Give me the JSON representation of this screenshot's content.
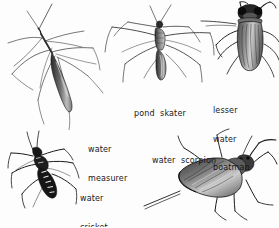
{
  "plate": {
    "title": "Water bugs",
    "background_color": "#fdfdfd",
    "ink_color": "#1a1a1a",
    "width": 279,
    "height": 227
  },
  "labels": {
    "water_measurer": {
      "line1": "water",
      "line2": "measurer"
    },
    "pond_skater": {
      "line1": "pond  skater"
    },
    "lesser_water_boatman": {
      "line1": "lesser",
      "line2": "water",
      "line3": "boatman"
    },
    "water_scorpion": {
      "line1": "water  scorpion"
    },
    "water_cricket": {
      "line1": "water",
      "line2": "cricket"
    }
  },
  "figures": [
    {
      "name": "water-measurer",
      "label": "water measurer",
      "position": "top-left"
    },
    {
      "name": "pond-skater",
      "label": "pond skater",
      "position": "top-center"
    },
    {
      "name": "lesser-water-boatman",
      "label": "lesser water boatman",
      "position": "top-right"
    },
    {
      "name": "water-cricket",
      "label": "water cricket",
      "position": "bottom-left"
    },
    {
      "name": "water-scorpion",
      "label": "water scorpion",
      "position": "bottom-right"
    }
  ]
}
